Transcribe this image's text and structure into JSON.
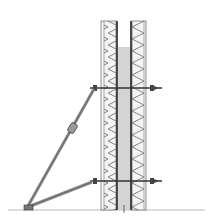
{
  "diagram": {
    "title": "",
    "colors": {
      "background": "#ffffff",
      "line": "#555555",
      "dark_line": "#222222",
      "concrete": "#d4d4d4",
      "panel": "#f2f2f2",
      "brace": "#888888",
      "ground": "#aaaaaa"
    },
    "elements": [
      {
        "id": "formwork-left-panel",
        "label": ""
      },
      {
        "id": "formwork-right-panel",
        "label": ""
      },
      {
        "id": "concrete-core",
        "label": ""
      },
      {
        "id": "upper-tie-rod",
        "label": ""
      },
      {
        "id": "lower-tie-rod",
        "label": ""
      },
      {
        "id": "long-brace-prop",
        "label": ""
      },
      {
        "id": "short-brace-prop",
        "label": ""
      },
      {
        "id": "turnbuckle",
        "label": ""
      },
      {
        "id": "base-plate",
        "label": ""
      },
      {
        "id": "ground-line",
        "label": ""
      }
    ]
  }
}
